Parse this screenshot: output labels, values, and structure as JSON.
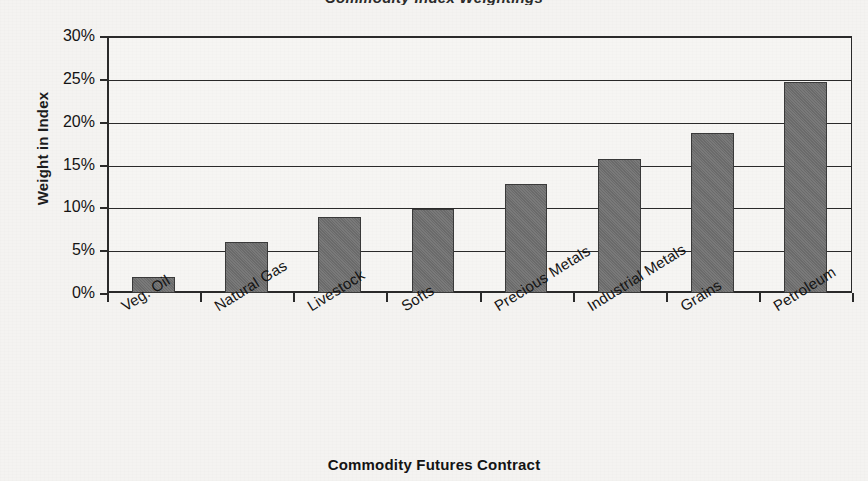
{
  "chart_data": {
    "type": "bar",
    "title": "",
    "partial_title_sliver": "Commodity Index Weightings",
    "xlabel": "Commodity Futures Contract",
    "ylabel": "Weight in Index",
    "categories": [
      "Veg. Oil",
      "Natural Gas",
      "Livestock",
      "Softs",
      "Precious Metals",
      "Industrial Metals",
      "Grains",
      "Petroleum"
    ],
    "values": [
      1.9,
      6.0,
      8.9,
      9.8,
      12.7,
      15.7,
      18.7,
      24.6
    ],
    "ylim": [
      0,
      30
    ],
    "ytick_labels": [
      "0%",
      "5%",
      "10%",
      "15%",
      "20%",
      "25%",
      "30%"
    ],
    "ytick_values": [
      0,
      5,
      10,
      15,
      20,
      25,
      30
    ],
    "grid": true,
    "legend": "none",
    "bar_color": "#6b6b6b",
    "axis_color": "#2a2a2a",
    "background": "#f4f3f1"
  }
}
